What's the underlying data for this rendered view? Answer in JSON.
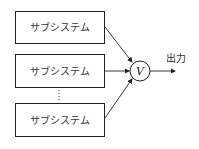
{
  "diagram": {
    "subsystems": [
      {
        "label": "サブシステム"
      },
      {
        "label": "サブシステム"
      },
      {
        "label": "サブシステム"
      }
    ],
    "ellipsis": "⋮",
    "operator": {
      "symbol": "V",
      "meaning": "vote/OR combiner"
    },
    "output": {
      "label": "出力"
    }
  }
}
